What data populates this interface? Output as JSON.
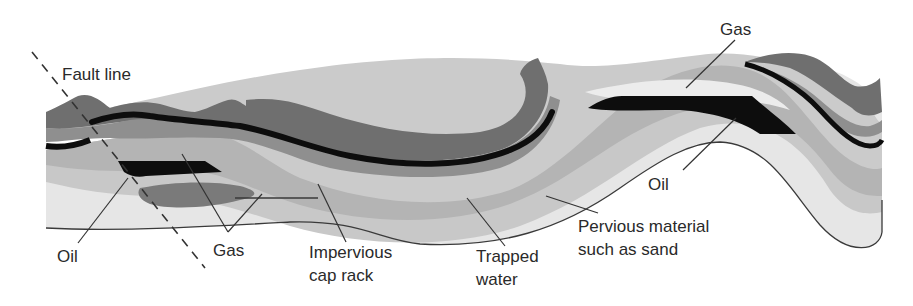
{
  "diagram": {
    "type": "geological-cross-section",
    "labels": {
      "fault_line": "Fault line",
      "gas_right": "Gas",
      "oil_right": "Oil",
      "oil_left": "Oil",
      "gas_left": "Gas",
      "cap_rock_line1": "Impervious",
      "cap_rock_line2": "cap rack",
      "trapped_water_line1": "Trapped",
      "trapped_water_line2": "water",
      "pervious_line1": "Pervious material",
      "pervious_line2": "such as sand"
    },
    "colors": {
      "background": "#ffffff",
      "dark_rock": "#6f6f6f",
      "mid_rock": "#8f8f8f",
      "cap_rock_band": "#b4b4b4",
      "light_band": "#c8c8c8",
      "pervious_sand": "#e6e6e6",
      "oil_black": "#0d0d0d",
      "text": "#2a2a2a"
    }
  }
}
